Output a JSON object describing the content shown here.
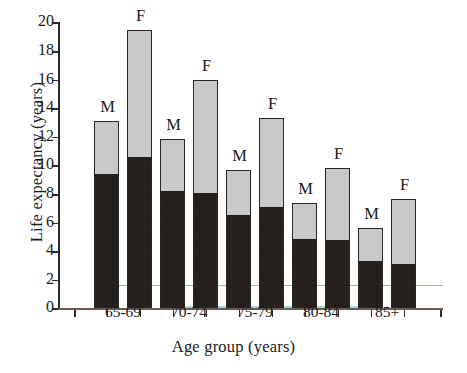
{
  "chart_data": {
    "type": "bar",
    "title": "",
    "xlabel": "Age group (years)",
    "ylabel": "Life expectancy (years)",
    "ylim": [
      0,
      20
    ],
    "yticks": [
      0,
      2,
      4,
      6,
      8,
      10,
      12,
      14,
      16,
      18,
      20
    ],
    "ytick_labels": [
      "0",
      "2",
      "4",
      "6",
      "8",
      "10",
      "12",
      "14",
      "16",
      "18",
      "20"
    ],
    "grid": false,
    "legend_position": "none",
    "stacked": true,
    "categories": [
      "65-69",
      "70-74",
      "75-79",
      "80-84",
      "85+"
    ],
    "bar_group_labels": [
      "M",
      "F"
    ],
    "series": [
      {
        "name": "Lower segment (dark)",
        "color": "#241f1b",
        "values_male": [
          9.4,
          8.25,
          6.55,
          4.9,
          3.35
        ],
        "values_female": [
          10.6,
          8.1,
          7.15,
          4.8,
          3.15
        ]
      },
      {
        "name": "Upper segment (light grey)",
        "color": "#c9c9c9",
        "values_male": [
          3.7,
          3.6,
          3.1,
          2.45,
          2.25
        ],
        "values_female": [
          8.9,
          7.85,
          6.15,
          5.05,
          4.5
        ]
      }
    ],
    "totals": {
      "male": [
        13.1,
        11.85,
        9.65,
        7.35,
        5.6
      ],
      "female": [
        19.5,
        15.95,
        13.3,
        9.85,
        7.65
      ]
    },
    "bars": [
      {
        "category": "65-69",
        "sex": "M",
        "total": 13.1,
        "lower": 9.4
      },
      {
        "category": "65-69",
        "sex": "F",
        "total": 19.5,
        "lower": 10.6
      },
      {
        "category": "70-74",
        "sex": "M",
        "total": 11.85,
        "lower": 8.25
      },
      {
        "category": "70-74",
        "sex": "F",
        "total": 15.95,
        "lower": 8.1
      },
      {
        "category": "75-79",
        "sex": "M",
        "total": 9.65,
        "lower": 6.55
      },
      {
        "category": "75-79",
        "sex": "F",
        "total": 13.3,
        "lower": 7.15
      },
      {
        "category": "80-84",
        "sex": "M",
        "total": 7.35,
        "lower": 4.9
      },
      {
        "category": "80-84",
        "sex": "F",
        "total": 9.85,
        "lower": 4.8
      },
      {
        "category": "85+",
        "sex": "M",
        "total": 5.6,
        "lower": 3.35
      },
      {
        "category": "85+",
        "sex": "F",
        "total": 7.65,
        "lower": 3.15
      }
    ]
  },
  "colors": {
    "dark_segment": "#241f1b",
    "light_segment": "#c9c9c9",
    "bar_outline": "#262626",
    "axis": "#2b2b2b",
    "baseline": "#6b5a52",
    "text": "#1a1a1a"
  }
}
